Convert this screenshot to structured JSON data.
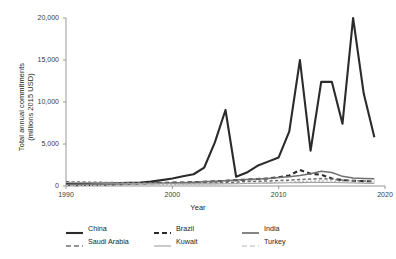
{
  "chart_data": {
    "type": "line",
    "title": "",
    "xlabel": "Year",
    "ylabel": "Total annual commitments\n(millions 2015 USD)",
    "ylabel_line1": "Total annual commitments",
    "ylabel_line2": "(millions 2015 USD)",
    "xlim": [
      1990,
      2020
    ],
    "ylim": [
      0,
      20000
    ],
    "xticks": [
      1990,
      2000,
      2010,
      2020
    ],
    "xtick_labels": [
      "1990",
      "2000",
      "2010",
      "2020"
    ],
    "yticks": [
      0,
      5000,
      10000,
      15000,
      20000
    ],
    "ytick_labels": [
      "0",
      "5,000",
      "10,000",
      "15,000",
      "20,000"
    ],
    "grid": false,
    "legend_position": "bottom",
    "x": [
      1990,
      1991,
      1992,
      1993,
      1994,
      1995,
      1996,
      1997,
      1998,
      1999,
      2000,
      2001,
      2002,
      2003,
      2004,
      2005,
      2006,
      2007,
      2008,
      2009,
      2010,
      2011,
      2012,
      2013,
      2014,
      2015,
      2016,
      2017,
      2018,
      2019
    ],
    "series": [
      {
        "name": "China",
        "style": "solid",
        "width": 2.1,
        "color": "#2b2b2b",
        "values": [
          330,
          300,
          290,
          300,
          320,
          350,
          380,
          420,
          520,
          700,
          900,
          1150,
          1400,
          2200,
          5200,
          9050,
          1100,
          1600,
          2400,
          2900,
          3400,
          6500,
          15000,
          4200,
          12400,
          12400,
          7400,
          20000,
          11000,
          5800
        ]
      },
      {
        "name": "Brazil",
        "style": "dashed",
        "width": 2.1,
        "color": "#2b2b2b",
        "values": [
          120,
          110,
          130,
          150,
          170,
          200,
          260,
          300,
          330,
          360,
          400,
          420,
          460,
          500,
          560,
          620,
          700,
          760,
          830,
          900,
          1050,
          1250,
          1900,
          1450,
          1350,
          900,
          700,
          620,
          580,
          520
        ]
      },
      {
        "name": "India",
        "style": "solid",
        "width": 1.5,
        "color": "#6f6f6f",
        "values": [
          180,
          175,
          190,
          200,
          210,
          230,
          250,
          280,
          310,
          340,
          370,
          400,
          450,
          500,
          560,
          620,
          700,
          760,
          820,
          900,
          1000,
          1100,
          1250,
          1450,
          1750,
          1600,
          1150,
          950,
          900,
          850
        ]
      },
      {
        "name": "Saudi Arabia",
        "style": "dashed",
        "width": 1.5,
        "color": "#6f6f6f",
        "values": [
          500,
          480,
          460,
          440,
          420,
          400,
          390,
          380,
          370,
          360,
          350,
          340,
          340,
          350,
          380,
          420,
          470,
          520,
          560,
          600,
          650,
          700,
          760,
          820,
          880,
          820,
          700,
          640,
          600,
          560
        ]
      },
      {
        "name": "Kuwait",
        "style": "solid",
        "width": 1.1,
        "color": "#9e9e9e",
        "values": [
          420,
          400,
          380,
          360,
          340,
          320,
          300,
          290,
          280,
          270,
          260,
          255,
          250,
          250,
          255,
          265,
          280,
          300,
          320,
          340,
          360,
          380,
          400,
          420,
          440,
          420,
          380,
          350,
          330,
          310
        ]
      },
      {
        "name": "Turkey",
        "style": "dashed",
        "width": 1.1,
        "color": "#b5b5b5",
        "values": [
          60,
          65,
          70,
          75,
          85,
          95,
          110,
          125,
          140,
          160,
          180,
          195,
          210,
          230,
          250,
          275,
          300,
          330,
          360,
          390,
          430,
          470,
          520,
          570,
          620,
          580,
          500,
          450,
          420,
          390
        ]
      }
    ],
    "legend": [
      {
        "label": "China",
        "style": "solid",
        "width": 2.1,
        "color": "#2b2b2b"
      },
      {
        "label": "Brazil",
        "style": "dashed",
        "width": 2.1,
        "color": "#2b2b2b"
      },
      {
        "label": "India",
        "style": "solid",
        "width": 1.7,
        "color": "#6f6f6f"
      },
      {
        "label": "Saudi Arabia",
        "style": "dashed",
        "width": 1.5,
        "color": "#6f6f6f"
      },
      {
        "label": "Kuwait",
        "style": "solid",
        "width": 1.1,
        "color": "#9e9e9e"
      },
      {
        "label": "Turkey",
        "style": "dashed",
        "width": 1.1,
        "color": "#b5b5b5"
      }
    ]
  }
}
